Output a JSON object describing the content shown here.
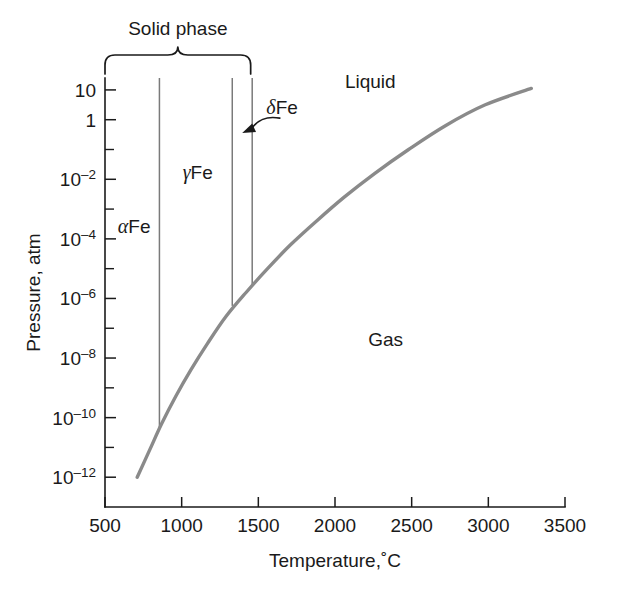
{
  "chart_data": {
    "type": "line",
    "title": "",
    "xlabel": "Temperature,˚C",
    "ylabel": "Pressure, atm",
    "xlim": [
      500,
      3500
    ],
    "ylim": [
      -13,
      1.4
    ],
    "yscale": "log",
    "grid": false,
    "legend": null,
    "x_ticks": [
      {
        "value": 500,
        "label": "500"
      },
      {
        "value": 1000,
        "label": "1000"
      },
      {
        "value": 1500,
        "label": "1500"
      },
      {
        "value": 2000,
        "label": "2000"
      },
      {
        "value": 2500,
        "label": "2500"
      },
      {
        "value": 3000,
        "label": "3000"
      },
      {
        "value": 3500,
        "label": "3500"
      }
    ],
    "y_ticks": [
      {
        "exponent": 1,
        "base": "10",
        "sup": "",
        "label": "10"
      },
      {
        "exponent": 0,
        "base": "1",
        "sup": "",
        "label": "1"
      },
      {
        "exponent": -1,
        "base": "",
        "sup": "",
        "label": ""
      },
      {
        "exponent": -2,
        "base": "10",
        "sup": "–2",
        "label": "10–2"
      },
      {
        "exponent": -3,
        "base": "",
        "sup": "",
        "label": ""
      },
      {
        "exponent": -4,
        "base": "10",
        "sup": "–4",
        "label": "10–4"
      },
      {
        "exponent": -5,
        "base": "",
        "sup": "",
        "label": ""
      },
      {
        "exponent": -6,
        "base": "10",
        "sup": "–6",
        "label": "10–6"
      },
      {
        "exponent": -7,
        "base": "",
        "sup": "",
        "label": ""
      },
      {
        "exponent": -8,
        "base": "10",
        "sup": "–8",
        "label": "10–8"
      },
      {
        "exponent": -9,
        "base": "",
        "sup": "",
        "label": ""
      },
      {
        "exponent": -10,
        "base": "10",
        "sup": "–10",
        "label": "10–10"
      },
      {
        "exponent": -11,
        "base": "",
        "sup": "",
        "label": ""
      },
      {
        "exponent": -12,
        "base": "10",
        "sup": "–12",
        "label": "10–12"
      }
    ],
    "series": [
      {
        "name": "sublimation-vaporization-curve",
        "color": "#8a8a8a",
        "points": [
          {
            "x": 710,
            "y_exp": -12.0
          },
          {
            "x": 790,
            "y_exp": -11.1
          },
          {
            "x": 870,
            "y_exp": -10.2
          },
          {
            "x": 960,
            "y_exp": -9.3
          },
          {
            "x": 1060,
            "y_exp": -8.4
          },
          {
            "x": 1170,
            "y_exp": -7.5
          },
          {
            "x": 1290,
            "y_exp": -6.6
          },
          {
            "x": 1420,
            "y_exp": -5.8
          },
          {
            "x": 1560,
            "y_exp": -5.0
          },
          {
            "x": 1710,
            "y_exp": -4.2
          },
          {
            "x": 1880,
            "y_exp": -3.4
          },
          {
            "x": 2060,
            "y_exp": -2.6
          },
          {
            "x": 2260,
            "y_exp": -1.8
          },
          {
            "x": 2480,
            "y_exp": -1.0
          },
          {
            "x": 2720,
            "y_exp": -0.2
          },
          {
            "x": 2980,
            "y_exp": 0.5
          },
          {
            "x": 3280,
            "y_exp": 1.05
          }
        ]
      }
    ],
    "phase_boundaries": [
      {
        "name": "alpha-gamma-boundary",
        "x": 855,
        "y_top_exp": 1.4,
        "y_bottom_exp": -10.35
      },
      {
        "name": "gamma-delta-boundary",
        "x": 1330,
        "y_top_exp": 1.4,
        "y_bottom_exp": -6.25
      },
      {
        "name": "delta-liquid-boundary",
        "x": 1460,
        "y_top_exp": 1.4,
        "y_bottom_exp": -5.55
      }
    ],
    "region_labels": [
      {
        "name": "alpha-fe",
        "greek": "α",
        "text": "Fe",
        "x": 690,
        "y_exp": -3.8
      },
      {
        "name": "gamma-fe",
        "greek": "γ",
        "text": "Fe",
        "x": 1105,
        "y_exp": -2.0
      },
      {
        "name": "delta-fe",
        "greek": "δ",
        "text": "Fe",
        "x": 1655,
        "y_exp": 0.2
      },
      {
        "name": "liquid",
        "greek": "",
        "text": "Liquid",
        "x": 2230,
        "y_exp": 1.05
      },
      {
        "name": "gas",
        "greek": "",
        "text": "Gas",
        "x": 2330,
        "y_exp": -7.6
      }
    ],
    "annotations": [
      {
        "name": "delta-fe-callout-arrow",
        "from_x": 1640,
        "from_y_exp": 0.05,
        "to_x": 1395,
        "to_y_exp": -0.45
      },
      {
        "name": "solid-phase-bracket",
        "label": "Solid phase",
        "x_start": 500,
        "x_end": 1450,
        "label_x": 975
      }
    ]
  },
  "labels": {
    "solid_phase": "Solid phase",
    "liquid": "Liquid",
    "gas": "Gas",
    "alpha_symbol": "α",
    "gamma_symbol": "γ",
    "delta_symbol": "δ",
    "fe": "Fe",
    "y_axis_title": "Pressure, atm",
    "x_axis_title": "Temperature,˚C"
  },
  "colors": {
    "axis": "#1a1a1a",
    "curve": "#8a8a8a",
    "boundary": "#7a7a7a",
    "background": "#ffffff"
  }
}
